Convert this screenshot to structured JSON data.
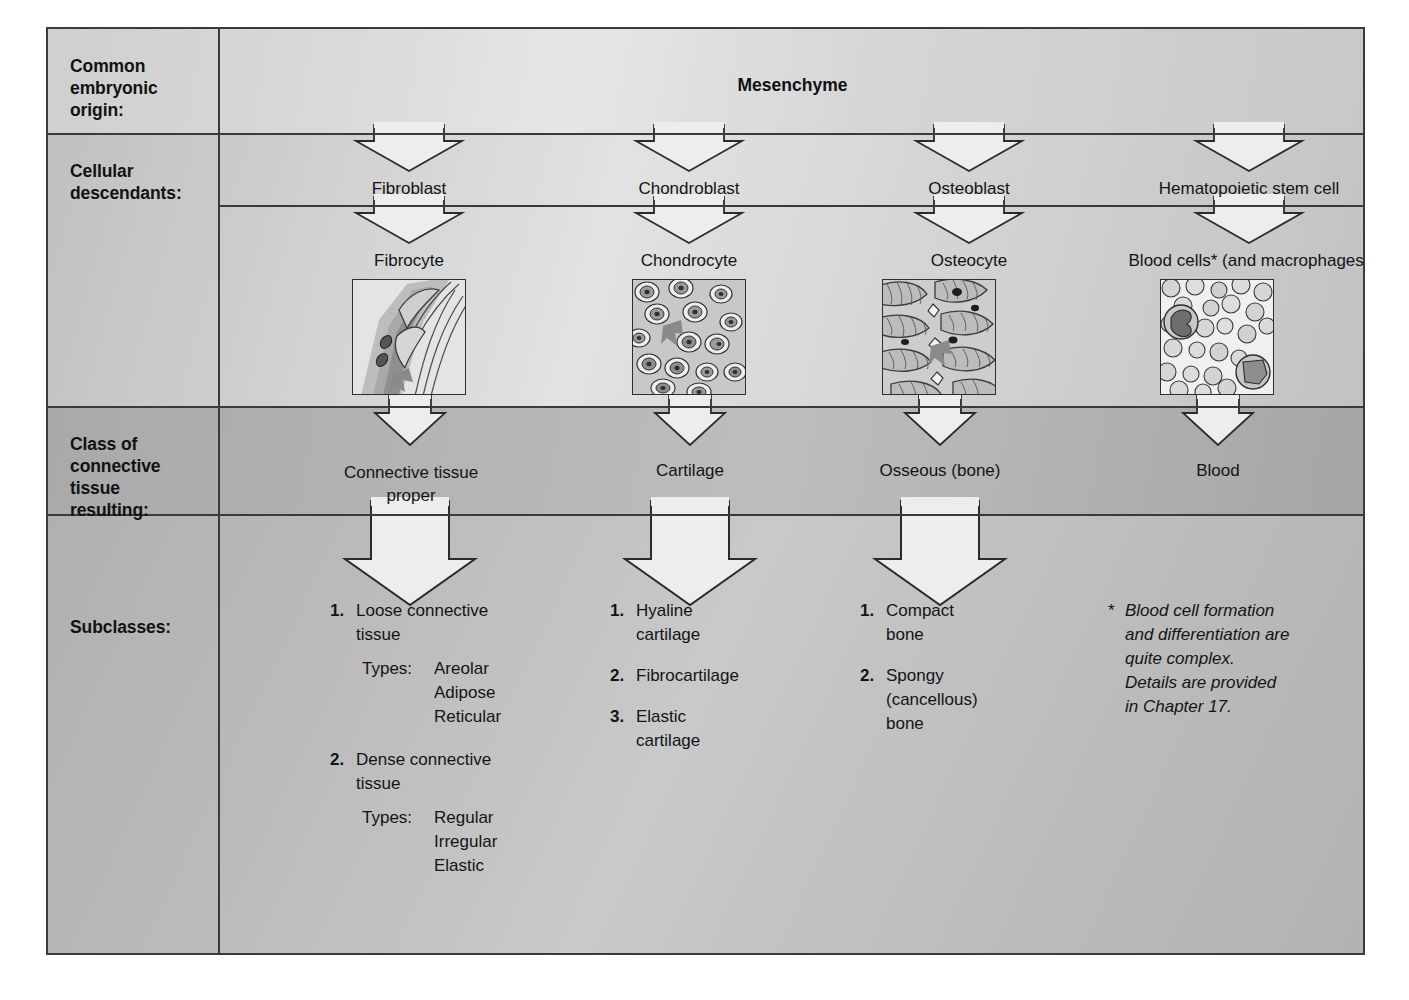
{
  "diagram": {
    "row_labels": {
      "origin": "Common\nembryonic\norigin:",
      "descendants": "Cellular\ndescendants:",
      "class": "Class of\nconnective\ntissue\nresulting:",
      "subclasses": "Subclasses:"
    },
    "origin": {
      "name": "Mesenchyme"
    },
    "blasts": [
      {
        "label": "Fibroblast"
      },
      {
        "label": "Chondroblast"
      },
      {
        "label": "Osteoblast"
      },
      {
        "label": "Hematopoietic stem cell"
      }
    ],
    "cytes": [
      {
        "label": "Fibrocyte",
        "micrograph": "fibrous-connective-tissue-micrograph"
      },
      {
        "label": "Chondrocyte",
        "micrograph": "cartilage-micrograph"
      },
      {
        "label": "Osteocyte",
        "micrograph": "osseous-bone-micrograph"
      },
      {
        "label": "Blood cells* (and macrophages)",
        "micrograph": "blood-smear-micrograph"
      }
    ],
    "classes": [
      {
        "line1": "Connective tissue",
        "line2": "proper"
      },
      {
        "line1": "Cartilage",
        "line2": ""
      },
      {
        "line1": "Osseous (bone)",
        "line2": ""
      },
      {
        "line1": "Blood",
        "line2": ""
      }
    ],
    "subclasses": [
      {
        "items": [
          {
            "num": "1.",
            "text": "Loose connective\ntissue"
          },
          {
            "num": "2.",
            "text": "Dense connective\ntissue"
          }
        ],
        "types": [
          {
            "label": "Types:",
            "list": [
              "Areolar",
              "Adipose",
              "Reticular"
            ]
          },
          {
            "label": "Types:",
            "list": [
              "Regular",
              "Irregular",
              "Elastic"
            ]
          }
        ]
      },
      {
        "items": [
          {
            "num": "1.",
            "text": "Hyaline\ncartilage"
          },
          {
            "num": "2.",
            "text": "Fibrocartilage"
          },
          {
            "num": "3.",
            "text": "Elastic\ncartilage"
          }
        ]
      },
      {
        "items": [
          {
            "num": "1.",
            "text": "Compact\nbone"
          },
          {
            "num": "2.",
            "text": "Spongy\n(cancellous)\nbone"
          }
        ]
      }
    ],
    "footnote": {
      "marker": "*",
      "text": "Blood cell formation\nand differentiation are\nquite complex.\nDetails are provided\nin Chapter 17."
    },
    "colors": {
      "frame_border": "#3a3a3a",
      "row_origin_bg": "#dadada",
      "row_descendants_bg": "#d0d0d0",
      "row_class_bg": "#b2b2b2",
      "row_subclasses_bg": "#bcbcbc",
      "arrow_fill": "#ededed",
      "text": "#141414"
    }
  }
}
